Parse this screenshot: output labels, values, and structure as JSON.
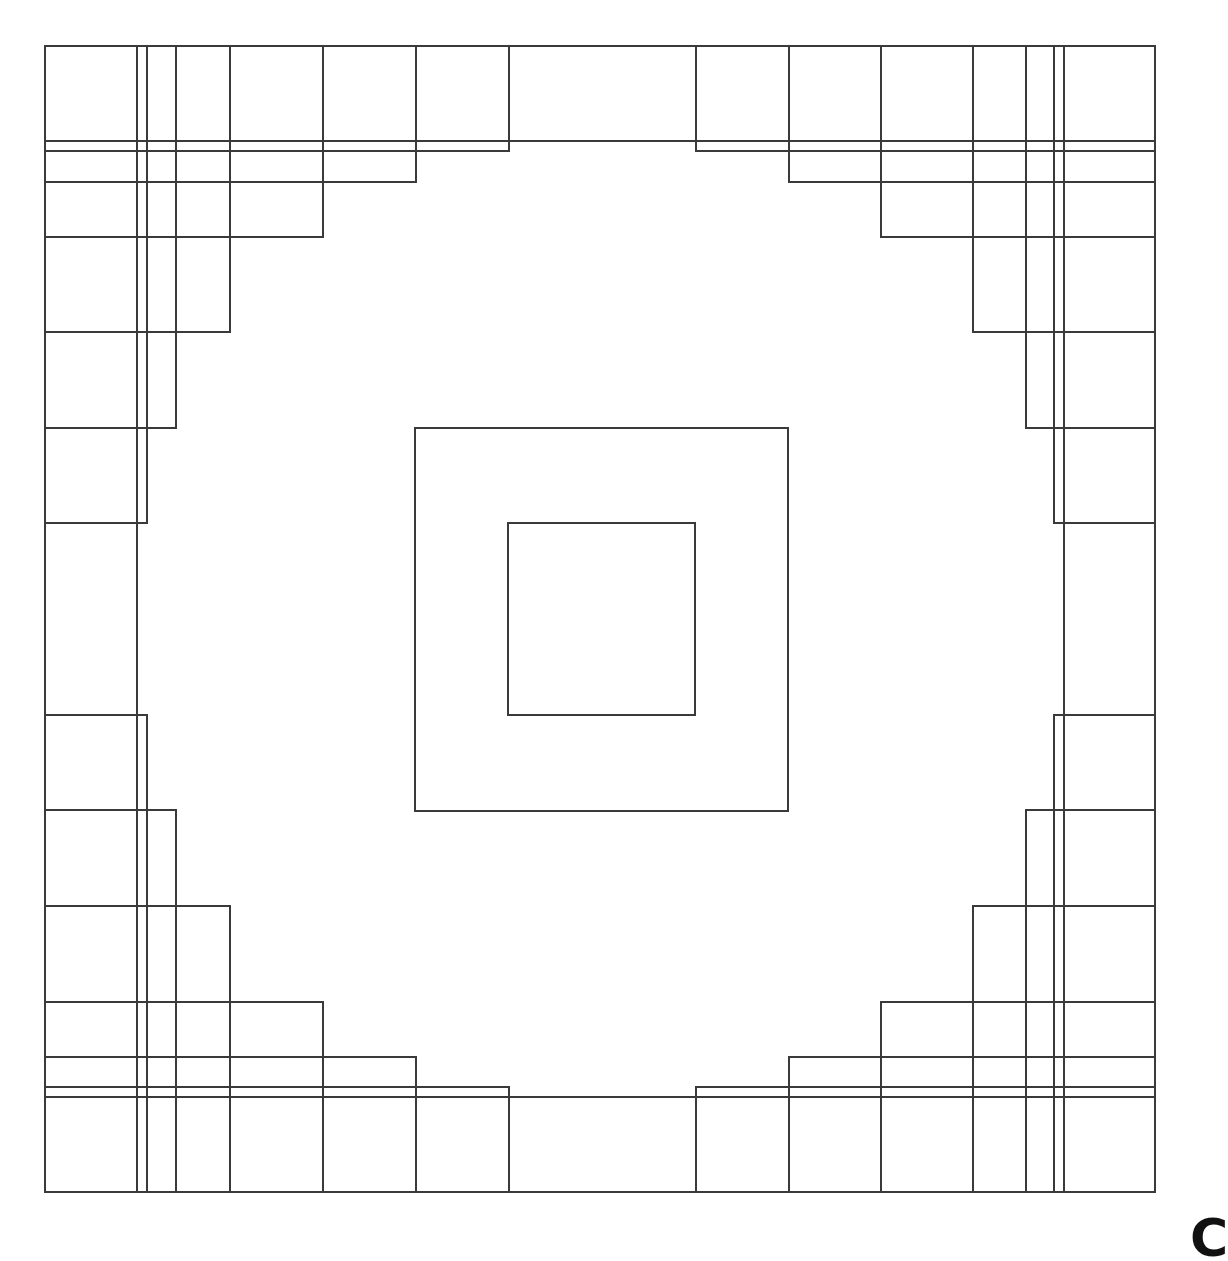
{
  "diagram": {
    "title": "",
    "canvas": {
      "width": 1199,
      "height": 1250
    },
    "stroke_color": "#3a3a3a",
    "background_color": "#ffffff",
    "outer_frame": {
      "x1": 45,
      "y1": 46,
      "x2": 1155,
      "y2": 1192
    },
    "full_lines": [
      {
        "name": "top-full-horizontal",
        "x1": 45,
        "y1": 141,
        "x2": 1155,
        "y2": 141
      },
      {
        "name": "bottom-full-horizontal",
        "x1": 45,
        "y1": 1097,
        "x2": 1155,
        "y2": 1097
      },
      {
        "name": "left-full-vertical",
        "x1": 137,
        "y1": 46,
        "x2": 137,
        "y2": 1192
      },
      {
        "name": "right-full-vertical",
        "x1": 1064,
        "y1": 46,
        "x2": 1064,
        "y2": 1192
      }
    ],
    "corner_staircases": {
      "top_left": [
        {
          "x1": 45,
          "y1": 46,
          "x2": 509,
          "y2": 151
        },
        {
          "x1": 45,
          "y1": 46,
          "x2": 416,
          "y2": 182
        },
        {
          "x1": 45,
          "y1": 46,
          "x2": 323,
          "y2": 237
        },
        {
          "x1": 45,
          "y1": 46,
          "x2": 230,
          "y2": 332
        },
        {
          "x1": 45,
          "y1": 46,
          "x2": 176,
          "y2": 428
        },
        {
          "x1": 45,
          "y1": 46,
          "x2": 147,
          "y2": 523
        }
      ],
      "top_right": [
        {
          "x1": 696,
          "y1": 46,
          "x2": 1155,
          "y2": 151
        },
        {
          "x1": 789,
          "y1": 46,
          "x2": 1155,
          "y2": 182
        },
        {
          "x1": 881,
          "y1": 46,
          "x2": 1155,
          "y2": 237
        },
        {
          "x1": 973,
          "y1": 46,
          "x2": 1155,
          "y2": 332
        },
        {
          "x1": 1026,
          "y1": 46,
          "x2": 1155,
          "y2": 428
        },
        {
          "x1": 1054,
          "y1": 46,
          "x2": 1155,
          "y2": 523
        }
      ],
      "bottom_left": [
        {
          "x1": 45,
          "y1": 1087,
          "x2": 509,
          "y2": 1192
        },
        {
          "x1": 45,
          "y1": 1057,
          "x2": 416,
          "y2": 1192
        },
        {
          "x1": 45,
          "y1": 1002,
          "x2": 323,
          "y2": 1192
        },
        {
          "x1": 45,
          "y1": 906,
          "x2": 230,
          "y2": 1192
        },
        {
          "x1": 45,
          "y1": 810,
          "x2": 176,
          "y2": 1192
        },
        {
          "x1": 45,
          "y1": 715,
          "x2": 147,
          "y2": 1192
        }
      ],
      "bottom_right": [
        {
          "x1": 696,
          "y1": 1087,
          "x2": 1155,
          "y2": 1192
        },
        {
          "x1": 789,
          "y1": 1057,
          "x2": 1155,
          "y2": 1192
        },
        {
          "x1": 881,
          "y1": 1002,
          "x2": 1155,
          "y2": 1192
        },
        {
          "x1": 973,
          "y1": 906,
          "x2": 1155,
          "y2": 1192
        },
        {
          "x1": 1026,
          "y1": 810,
          "x2": 1155,
          "y2": 1192
        },
        {
          "x1": 1054,
          "y1": 715,
          "x2": 1155,
          "y2": 1192
        }
      ]
    },
    "center_squares": [
      {
        "name": "center-outer-square",
        "x1": 415,
        "y1": 428,
        "x2": 788,
        "y2": 811
      },
      {
        "name": "center-inner-square",
        "x1": 508,
        "y1": 523,
        "x2": 695,
        "y2": 715
      }
    ],
    "corner_label": "C"
  }
}
